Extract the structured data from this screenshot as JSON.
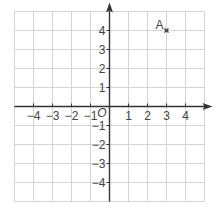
{
  "grid": {
    "x_min": -5,
    "x_max": 5,
    "y_min": -5,
    "y_max": 5,
    "origin_px": [
      109.5,
      106.5
    ],
    "unit_px": 19,
    "grid_color": "#d4d4d4",
    "axis_color": "#333333"
  },
  "axes": {
    "x_ticks": [
      {
        "value": -4,
        "label": "−4"
      },
      {
        "value": -3,
        "label": "−3"
      },
      {
        "value": -2,
        "label": "−2"
      },
      {
        "value": -1,
        "label": "−1"
      },
      {
        "value": 1,
        "label": "1"
      },
      {
        "value": 2,
        "label": "2"
      },
      {
        "value": 3,
        "label": "3"
      },
      {
        "value": 4,
        "label": "4"
      }
    ],
    "y_ticks": [
      {
        "value": 4,
        "label": "4"
      },
      {
        "value": 3,
        "label": "3"
      },
      {
        "value": 2,
        "label": "2"
      },
      {
        "value": 1,
        "label": "1"
      },
      {
        "value": -1,
        "label": "−1"
      },
      {
        "value": -2,
        "label": "−2"
      },
      {
        "value": -3,
        "label": "−3"
      },
      {
        "value": -4,
        "label": "−4"
      }
    ],
    "origin_label": "O"
  },
  "points": [
    {
      "name": "A",
      "x": 3,
      "y": 4,
      "marker": "cross"
    }
  ]
}
